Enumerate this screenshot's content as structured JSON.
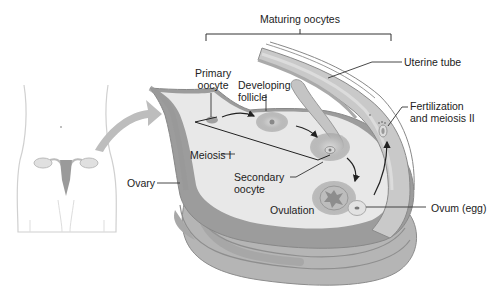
{
  "diagram": {
    "labels": {
      "maturing_oocytes": "Maturing oocytes",
      "uterine_tube": "Uterine tube",
      "primary_oocyte_line1": "Primary",
      "primary_oocyte_line2": "oocyte",
      "developing_follicle_line1": "Developing",
      "developing_follicle_line2": "follicle",
      "fertilization_line1": "Fertilization",
      "fertilization_line2": "and meiosis II",
      "meiosis_i": "Meiosis I",
      "secondary_oocyte_line1": "Secondary",
      "secondary_oocyte_line2": "oocyte",
      "ovary": "Ovary",
      "ovulation": "Ovulation",
      "ovum": "Ovum (egg)"
    },
    "colors": {
      "ovary_light": "#e6e6e6",
      "ovary_mid": "#b3b3b3",
      "ovary_dark": "#8c8c8c",
      "follicle": "#a8a8a8",
      "arrow": "#222222",
      "leader": "#333333"
    }
  }
}
